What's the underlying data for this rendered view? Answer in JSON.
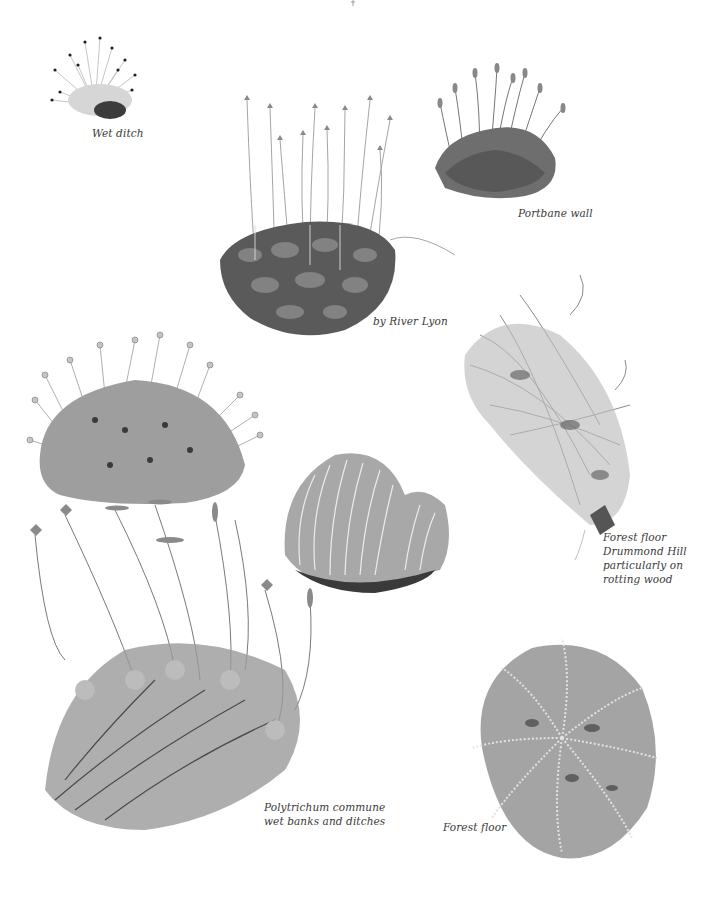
{
  "page": {
    "background": "#ffffff",
    "ink_color": "#3a3a3a"
  },
  "illustrations": [
    {
      "id": "wet-ditch-moss",
      "caption_lines": [
        "Wet ditch"
      ]
    },
    {
      "id": "portbane-wall-moss",
      "caption_lines": [
        "Portbane wall"
      ]
    },
    {
      "id": "river-lyon-moss",
      "caption_lines": [
        "by River Lyon"
      ]
    },
    {
      "id": "drummond-hill-moss",
      "caption_lines": [
        "Forest floor",
        "Drummond Hill",
        "particularly on",
        "rotting wood"
      ]
    },
    {
      "id": "cushion-moss-capsules",
      "caption_lines": []
    },
    {
      "id": "comb-moss-clump",
      "caption_lines": []
    },
    {
      "id": "polytrichum-commune",
      "caption_lines": [
        "Polytrichum commune",
        "wet banks and ditches"
      ]
    },
    {
      "id": "forest-floor-moss",
      "caption_lines": [
        "Forest floor"
      ]
    }
  ]
}
